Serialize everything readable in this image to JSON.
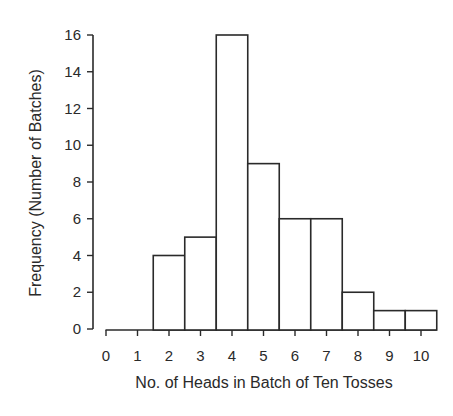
{
  "chart_data": {
    "type": "bar",
    "subtype": "histogram",
    "title": "",
    "xlabel": "No. of Heads in Batch of Ten Tosses",
    "ylabel": "Frequency (Number of Batches)",
    "categories": [
      "0",
      "1",
      "2",
      "3",
      "4",
      "5",
      "6",
      "7",
      "8",
      "9",
      "10"
    ],
    "values": [
      0,
      0,
      4,
      5,
      16,
      9,
      6,
      6,
      2,
      1,
      1
    ],
    "ylim": [
      0,
      16
    ],
    "yticks": [
      0,
      2,
      4,
      6,
      8,
      10,
      12,
      14,
      16
    ],
    "xticks": [
      0,
      1,
      2,
      3,
      4,
      5,
      6,
      7,
      8,
      9,
      10
    ],
    "grid": false,
    "legend": null,
    "colors": {
      "bar_fill": "#ffffff",
      "bar_stroke": "#2a2a2a",
      "axis": "#2a2a2a"
    }
  }
}
